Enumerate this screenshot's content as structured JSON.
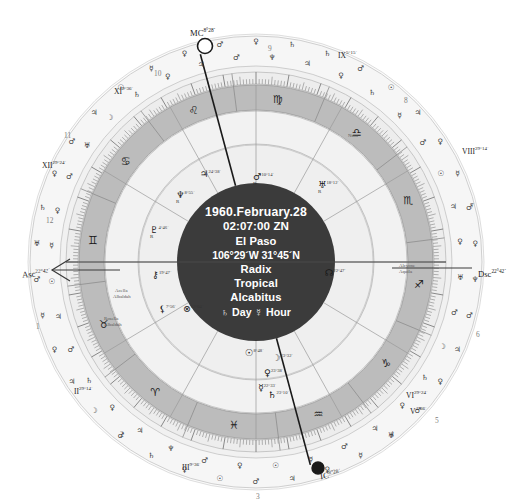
{
  "chart": {
    "type": "astrological-natal-wheel",
    "center": {
      "date": "1960.February.28",
      "time": "02:07:00 ZN",
      "location": "El Paso",
      "coordinates": "106°29´W 31°45´N",
      "chart_type": "Radix",
      "zodiac": "Tropical",
      "house_system": "Alcabitus",
      "rulers": "♄ Day ☿ Hour"
    },
    "colors": {
      "background": "#ffffff",
      "center_disc": "#3a3a3a",
      "center_text": "#ffffff",
      "zodiac_band": "#b9b9b9",
      "inner_ring": "#ededed",
      "house_ring": "#e4e4e4",
      "outer_ring": "#f4f4f4",
      "line": "#8a8a8a",
      "angle_line": "#1a1a1a"
    },
    "angles": [
      {
        "name": "MC",
        "label": "MC",
        "degree": "8°28´"
      },
      {
        "name": "ASC",
        "label": "Asc",
        "degree": "22°42´"
      },
      {
        "name": "DSC",
        "label": "Dsc",
        "degree": "22°42´"
      },
      {
        "name": "IC",
        "label": "IC",
        "degree": "8°28´"
      }
    ],
    "cusps": [
      {
        "house": "IX",
        "label": "IX",
        "degree": "5°15´"
      },
      {
        "house": "XI",
        "label": "XI",
        "degree": "9°36´"
      },
      {
        "house": "XII",
        "label": "XII",
        "degree": "29°24´"
      },
      {
        "house": "VIII",
        "label": "VIII",
        "degree": "29°14´"
      },
      {
        "house": "II",
        "label": "II",
        "degree": "29°14´"
      },
      {
        "house": "VI",
        "label": "VI",
        "degree": "29°24´"
      },
      {
        "house": "III",
        "label": "III",
        "degree": "9°36´"
      },
      {
        "house": "V",
        "label": "V",
        "degree": "4°36´"
      }
    ],
    "house_numbers": [
      "1",
      "2",
      "3",
      "4",
      "5",
      "6",
      "7",
      "8",
      "9",
      "10",
      "11",
      "12"
    ],
    "sign_glyphs": [
      {
        "sign": "Aries",
        "glyph": "♈"
      },
      {
        "sign": "Taurus",
        "glyph": "♉"
      },
      {
        "sign": "Gemini",
        "glyph": "♊"
      },
      {
        "sign": "Cancer",
        "glyph": "♋"
      },
      {
        "sign": "Leo",
        "glyph": "♌"
      },
      {
        "sign": "Virgo",
        "glyph": "♍"
      },
      {
        "sign": "Libra",
        "glyph": "♎"
      },
      {
        "sign": "Scorpio",
        "glyph": "♏"
      },
      {
        "sign": "Sagittarius",
        "glyph": "♐"
      },
      {
        "sign": "Capricorn",
        "glyph": "♑"
      },
      {
        "sign": "Aquarius",
        "glyph": "♒"
      },
      {
        "sign": "Pisces",
        "glyph": "♓"
      }
    ],
    "planets": [
      {
        "name": "Neptune",
        "glyph": "♆",
        "degree": "8°55´",
        "retrograde": "R",
        "x": 176,
        "y": 190
      },
      {
        "name": "Pluto",
        "glyph": "♇",
        "degree": "4°46´",
        "retrograde": "R",
        "x": 150,
        "y": 225
      },
      {
        "name": "Jupiter",
        "glyph": "♃",
        "degree": "24°38´",
        "retrograde": "",
        "x": 200,
        "y": 169
      },
      {
        "name": "Uranus",
        "glyph": "♅",
        "degree": "18°12´",
        "retrograde": "R",
        "x": 318,
        "y": 180
      },
      {
        "name": "Mars",
        "glyph": "♂",
        "degree": "10°14´",
        "retrograde": "R",
        "x": 253,
        "y": 172
      },
      {
        "name": "Sun",
        "glyph": "☉",
        "degree": "8°48´",
        "retrograde": "",
        "x": 245,
        "y": 348
      },
      {
        "name": "Moon",
        "glyph": "☽",
        "degree": "23°32´",
        "retrograde": "",
        "x": 272,
        "y": 353
      },
      {
        "name": "Venus",
        "glyph": "♀",
        "degree": "23°38´",
        "retrograde": "",
        "x": 264,
        "y": 368
      },
      {
        "name": "Mercury",
        "glyph": "☿",
        "degree": "22°33´",
        "retrograde": "",
        "x": 258,
        "y": 383
      },
      {
        "name": "Saturn",
        "glyph": "♄",
        "degree": "23°10´",
        "retrograde": "",
        "x": 268,
        "y": 390
      },
      {
        "name": "NorthNode",
        "glyph": "☊",
        "degree": "22°47´",
        "retrograde": "",
        "x": 325,
        "y": 268
      },
      {
        "name": "Chiron",
        "glyph": "⚷",
        "degree": "19°47´",
        "retrograde": "",
        "x": 152,
        "y": 270
      },
      {
        "name": "Lilith",
        "glyph": "⚸",
        "degree": "7°56´",
        "retrograde": "",
        "x": 159,
        "y": 304
      },
      {
        "name": "PartFortune",
        "glyph": "⊗",
        "degree": "12°04´",
        "retrograde": "",
        "x": 183,
        "y": 304
      }
    ],
    "fixed_stars": [
      {
        "name": "Nusa",
        "x": 348,
        "y": 133
      },
      {
        "name": "Alcyone",
        "x": 399,
        "y": 263
      },
      {
        "name": "Aquila",
        "x": 399,
        "y": 269
      },
      {
        "name": "Acella",
        "x": 115,
        "y": 288
      },
      {
        "name": "Albaldah",
        "x": 113,
        "y": 294
      },
      {
        "name": "Rosella",
        "x": 104,
        "y": 316
      },
      {
        "name": "Albaldah",
        "x": 104,
        "y": 322
      }
    ],
    "outer_ring_glyphs": [
      "♀",
      "♄",
      "♄",
      "♂",
      "☉",
      "♃",
      "♀",
      "☿",
      "♂",
      "♀",
      "♆",
      "♂",
      "♃",
      "♀",
      "♂",
      "♅",
      "☿",
      "♀",
      "♃",
      "♂",
      "☉",
      "♀",
      "♄",
      "♂",
      "☽",
      "♃",
      "♀",
      "☿",
      "♂",
      "♅",
      "♄",
      "♀",
      "♂",
      "♃",
      "☉",
      "☿",
      "♀",
      "♂",
      "♆",
      "♃",
      "♀",
      "♄",
      "☿",
      "♂",
      "☉",
      "♃",
      "♀",
      "♅",
      "♂",
      "☽",
      "♄",
      "♀",
      "♃",
      "♂",
      "☿",
      "☉",
      "♀",
      "♂",
      "♆",
      "♃",
      "♀",
      "♄",
      "♂",
      "♃",
      "☉",
      "☿",
      "♀",
      "♂",
      "♅",
      "☽",
      "♄",
      "♀",
      "♃",
      "♂"
    ]
  }
}
